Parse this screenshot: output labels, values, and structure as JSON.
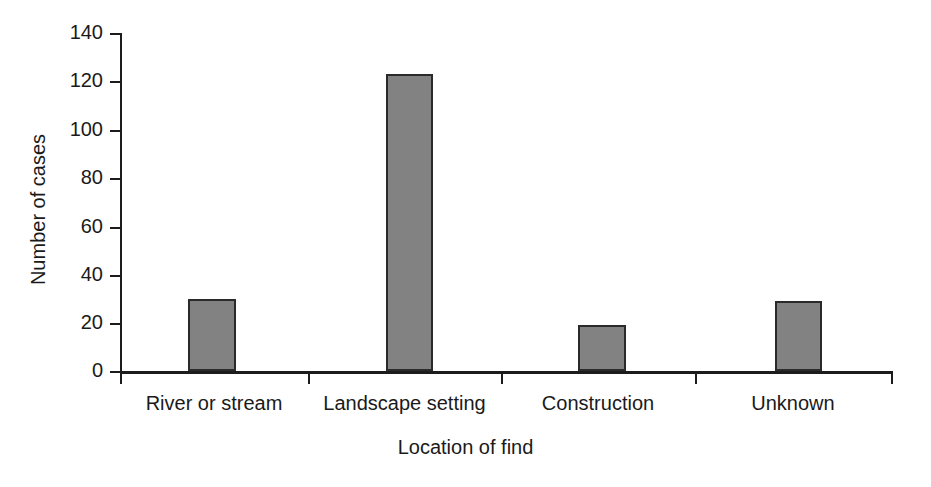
{
  "chart_data": {
    "type": "bar",
    "title": "",
    "categories": [
      "River or stream",
      "Landscape setting",
      "Construction",
      "Unknown"
    ],
    "values": [
      30,
      123,
      19,
      29
    ],
    "xlabel": "Location of find",
    "ylabel": "Number of cases",
    "ylim": [
      0,
      140
    ],
    "yticks": [
      0,
      20,
      40,
      60,
      80,
      100,
      120,
      140
    ],
    "ytick_labels": [
      "0",
      "20",
      "40",
      "60",
      "80",
      "100",
      "120",
      "140"
    ],
    "grid": false,
    "legend": false,
    "bar_fill_color": "#828282",
    "bar_edge_color": "#2a2a2a",
    "axis_color": "#1c1c1c",
    "background_color": "#ffffff"
  },
  "axes": {
    "y_title": "Number of cases",
    "x_title": "Location of find",
    "y_tick_0": "0",
    "y_tick_1": "20",
    "y_tick_2": "40",
    "y_tick_3": "60",
    "y_tick_4": "80",
    "y_tick_5": "100",
    "y_tick_6": "120",
    "y_tick_7": "140"
  },
  "categories": {
    "cat_0": "River or stream",
    "cat_1": "Landscape setting",
    "cat_2": "Construction",
    "cat_3": "Unknown"
  }
}
